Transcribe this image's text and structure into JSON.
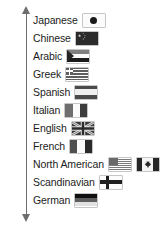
{
  "figure": {
    "axis": {
      "name": "vertical-double-arrow",
      "orientation": "vertical",
      "arrowheads": "both"
    },
    "rows": [
      {
        "label": "Japanese",
        "flags": [
          "japan"
        ]
      },
      {
        "label": "Chinese",
        "flags": [
          "china"
        ]
      },
      {
        "label": "Arabic",
        "flags": [
          "arab"
        ]
      },
      {
        "label": "Greek",
        "flags": [
          "greece"
        ]
      },
      {
        "label": "Spanish",
        "flags": [
          "spain"
        ]
      },
      {
        "label": "Italian",
        "flags": [
          "italy"
        ]
      },
      {
        "label": "English",
        "flags": [
          "united-kingdom"
        ]
      },
      {
        "label": "French",
        "flags": [
          "france"
        ]
      },
      {
        "label": "North American",
        "flags": [
          "united-states",
          "canada"
        ]
      },
      {
        "label": "Scandinavian",
        "flags": [
          "finland"
        ]
      },
      {
        "label": "German",
        "flags": [
          "germany"
        ]
      }
    ]
  },
  "colors": {
    "text": "#1c1c1c",
    "axis": "#6d6d6d",
    "flag_border": "#8d8d8d",
    "background": "#ffffff"
  }
}
